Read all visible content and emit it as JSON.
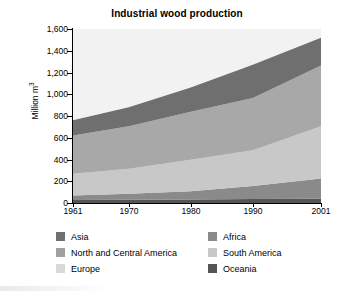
{
  "chart_data": {
    "type": "area",
    "title": "Industrial wood production",
    "xlabel": "",
    "ylabel": "Million m 3",
    "ylabel_text": "Million m",
    "ylabel_sup": "3",
    "x": [
      1961,
      1970,
      1980,
      1990,
      2001
    ],
    "xlim": [
      1961,
      2001
    ],
    "ylim": [
      0,
      1600
    ],
    "ytick_labels": [
      "0",
      "200",
      "400",
      "600",
      "800",
      "1,000",
      "1,200",
      "1,400",
      "1,600"
    ],
    "ytick_values": [
      0,
      200,
      400,
      600,
      800,
      1000,
      1200,
      1400,
      1600
    ],
    "xtick_labels": [
      "1961",
      "1970",
      "1980",
      "1990",
      "2001"
    ],
    "grid": false,
    "stacked": true,
    "legend_position": "bottom",
    "series": [
      {
        "name": "Oceania",
        "color": "#555555",
        "values": [
          28,
          30,
          33,
          36,
          40
        ]
      },
      {
        "name": "Africa",
        "color": "#8a8a8a",
        "values": [
          42,
          55,
          75,
          120,
          185
        ]
      },
      {
        "name": "South America",
        "color": "#c8c8c8",
        "values": [
          200,
          230,
          290,
          330,
          480
        ]
      },
      {
        "name": "Europe",
        "color": "#a8a8a8",
        "values": [
          350,
          390,
          440,
          480,
          560
        ]
      },
      {
        "name": "North and Central America",
        "color": "#6f6f6f",
        "values": [
          140,
          175,
          225,
          305,
          255
        ]
      },
      {
        "name": "Asia",
        "color": "#efefef",
        "values": [
          0,
          0,
          0,
          0,
          0
        ]
      }
    ],
    "totals": [
      760,
      880,
      1063,
      1271,
      1520
    ],
    "annotations": []
  },
  "legend": {
    "items": [
      {
        "label": "Asia",
        "color": "#6f6f6f"
      },
      {
        "label": "Africa",
        "color": "#8a8a8a"
      },
      {
        "label": "North and Central America",
        "color": "#a0a0a0"
      },
      {
        "label": "South America",
        "color": "#c8c8c8"
      },
      {
        "label": "Europe",
        "color": "#d9d9d9"
      },
      {
        "label": "Oceania",
        "color": "#555555"
      }
    ]
  }
}
